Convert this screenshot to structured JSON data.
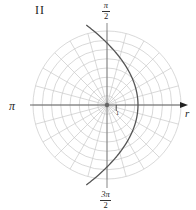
{
  "panel": {
    "label": "II"
  },
  "labels": {
    "angle_zero_axis": "r",
    "angle_pi": "π",
    "angle_pi_over_2": {
      "numerator": "π",
      "denominator": "2"
    },
    "angle_3pi_over_2": {
      "numerator": "3π",
      "denominator": "2"
    },
    "unit_tick": "1"
  },
  "colors": {
    "grid": "#c8c8c8",
    "axis": "#555555",
    "curve": "#555555",
    "background": "#ffffff"
  },
  "chart_data": {
    "type": "line",
    "coordinate_system": "polar",
    "title": "II",
    "grid": {
      "on": true,
      "circles_r": [
        1,
        2,
        3,
        4,
        5,
        6,
        7,
        8
      ],
      "ray_spacing_deg": 15,
      "ray_count": 24
    },
    "axis_labels": {
      "theta_0": "r",
      "theta_pi_over_2": "π/2",
      "theta_pi": "π",
      "theta_3pi_over_2": "3π/2"
    },
    "tick_labels": [
      "1"
    ],
    "series": [
      {
        "name": "curve",
        "equation_estimate": "r = 6.7 / (1 + cos θ)",
        "shape": "parabola opening left, vertex on positive polar axis",
        "vertex": {
          "r": 3.35,
          "theta_deg": 0
        },
        "theta_range_deg": [
          -105,
          105
        ],
        "points": [
          {
            "theta_deg": -105,
            "r": 9.0
          },
          {
            "theta_deg": -90,
            "r": 6.7
          },
          {
            "theta_deg": -60,
            "r": 4.47
          },
          {
            "theta_deg": -30,
            "r": 3.59
          },
          {
            "theta_deg": 0,
            "r": 3.35
          },
          {
            "theta_deg": 30,
            "r": 3.59
          },
          {
            "theta_deg": 60,
            "r": 4.47
          },
          {
            "theta_deg": 90,
            "r": 6.7
          },
          {
            "theta_deg": 105,
            "r": 9.0
          }
        ]
      }
    ],
    "axis_range_r": [
      0,
      8
    ]
  },
  "geometry": {
    "cx": 107,
    "cy": 105,
    "unit_px": 9.25,
    "curve_p": 6.7,
    "curve_theta_max_deg": 104.5,
    "axis_x_left": 30,
    "axis_x_right": 188,
    "axis_y_top": 23,
    "axis_y_bottom": 188
  }
}
